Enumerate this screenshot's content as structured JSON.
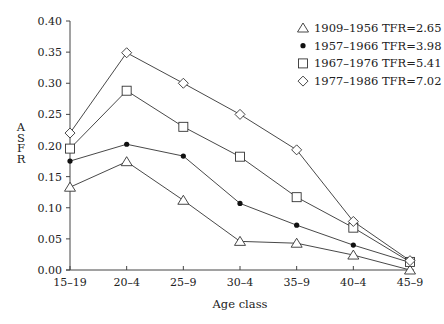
{
  "chart_data": {
    "type": "line",
    "title": "",
    "xlabel": "Age class",
    "ylabel": "ASFR",
    "categories": [
      "15–19",
      "20–4",
      "25–9",
      "30–4",
      "35–9",
      "40–4",
      "45–9"
    ],
    "ylim": [
      0.0,
      0.4
    ],
    "yticks": [
      "0.00",
      "0.05",
      "0.10",
      "0.15",
      "0.20",
      "0.25",
      "0.30",
      "0.35",
      "0.40"
    ],
    "grid": false,
    "legend_position": "upper right",
    "series": [
      {
        "name": "1909–1956 TFR=2.65",
        "marker": "triangle-open",
        "values": [
          0.133,
          0.174,
          0.112,
          0.046,
          0.043,
          0.024,
          0.0
        ]
      },
      {
        "name": "1957–1966 TFR=3.98",
        "marker": "circle-filled",
        "values": [
          0.175,
          0.202,
          0.183,
          0.107,
          0.072,
          0.04,
          0.012
        ]
      },
      {
        "name": "1967–1976 TFR=5.41",
        "marker": "square-open",
        "values": [
          0.195,
          0.288,
          0.23,
          0.182,
          0.117,
          0.068,
          0.013
        ]
      },
      {
        "name": "1977–1986 TFR=7.02",
        "marker": "diamond-open",
        "values": [
          0.22,
          0.349,
          0.3,
          0.25,
          0.193,
          0.078,
          0.015
        ]
      }
    ]
  },
  "layout": {
    "plot_left": 70,
    "plot_right": 410,
    "plot_top": 21,
    "plot_bottom": 270,
    "line_color": "#333333",
    "axis_color": "#444444"
  }
}
